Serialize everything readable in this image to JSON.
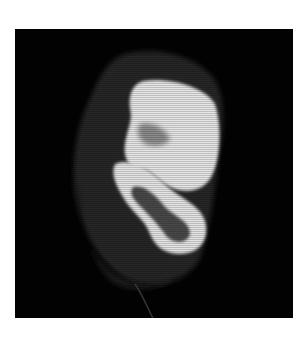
{
  "image": {
    "description": "Grayscale cross-sectional scan image showing bright bone structures on black background",
    "background_color": "#ffffff",
    "frame_color": "#020202",
    "bone_color": "#e8e8e8"
  }
}
